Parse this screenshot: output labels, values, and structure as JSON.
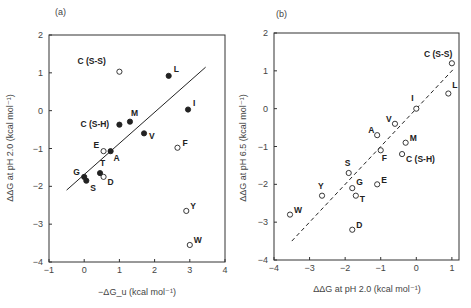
{
  "chart_data": [
    {
      "id": "a",
      "type": "scatter",
      "panel_label": "(a)",
      "title": "",
      "xlabel": "−ΔG_u (kcal mol⁻¹)",
      "ylabel": "ΔΔG at pH 2.0 (kcal mol⁻¹)",
      "xlim": [
        -1,
        4
      ],
      "ylim": [
        -4,
        2
      ],
      "xticks": [
        -1,
        0,
        1,
        2,
        3,
        4
      ],
      "yticks": [
        2,
        1,
        0,
        -1,
        -2,
        -3,
        -4
      ],
      "ytick_labels": [
        "2",
        "1",
        "0",
        "−1",
        "−2",
        "−3",
        "−4"
      ],
      "xtick_labels": [
        "−1",
        "0",
        "1",
        "2",
        "3",
        "4"
      ],
      "grid": false,
      "fit_line": {
        "style": "solid",
        "x": [
          -0.5,
          3.45
        ],
        "y": [
          -2.1,
          1.15
        ]
      },
      "points": [
        {
          "label": "C (S-S)",
          "x": 1.0,
          "y": 1.03,
          "marker": "open",
          "lx": -42,
          "ly": -8
        },
        {
          "label": "L",
          "x": 2.4,
          "y": 0.92,
          "marker": "filled",
          "lx": 5,
          "ly": -4
        },
        {
          "label": "I",
          "x": 2.95,
          "y": 0.03,
          "marker": "filled",
          "lx": 5,
          "ly": -4
        },
        {
          "label": "M",
          "x": 1.3,
          "y": -0.29,
          "marker": "filled",
          "lx": 1,
          "ly": -6
        },
        {
          "label": "C (S-H)",
          "x": 1.0,
          "y": -0.37,
          "marker": "filled",
          "lx": -39,
          "ly": 2
        },
        {
          "label": "V",
          "x": 1.7,
          "y": -0.6,
          "marker": "filled",
          "lx": 5,
          "ly": 6
        },
        {
          "label": "F",
          "x": 2.65,
          "y": -0.98,
          "marker": "open",
          "lx": 5,
          "ly": -2
        },
        {
          "label": "E",
          "x": 0.55,
          "y": -1.07,
          "marker": "open",
          "lx": -10,
          "ly": -3
        },
        {
          "label": "A",
          "x": 0.75,
          "y": -1.07,
          "marker": "filled",
          "lx": 3,
          "ly": 10
        },
        {
          "label": "T",
          "x": 0.45,
          "y": -1.65,
          "marker": "filled",
          "lx": 0,
          "ly": -7
        },
        {
          "label": "D",
          "x": 0.55,
          "y": -1.75,
          "marker": "open",
          "lx": 4,
          "ly": 8
        },
        {
          "label": "G",
          "x": 0.0,
          "y": -1.75,
          "marker": "filled",
          "lx": -11,
          "ly": -2
        },
        {
          "label": "S",
          "x": 0.06,
          "y": -1.85,
          "marker": "filled",
          "lx": 4,
          "ly": 10
        },
        {
          "label": "Y",
          "x": 2.9,
          "y": -2.65,
          "marker": "open",
          "lx": 4,
          "ly": -2
        },
        {
          "label": "W",
          "x": 3.0,
          "y": -3.55,
          "marker": "open",
          "lx": 4,
          "ly": -2
        }
      ],
      "frame_px": {
        "left": 49,
        "right": 225,
        "top": 35,
        "bottom": 262
      }
    },
    {
      "id": "b",
      "type": "scatter",
      "panel_label": "(b)",
      "title": "",
      "xlabel": "ΔΔG at pH 2.0 (kcal mol⁻¹)",
      "ylabel": "ΔΔG at pH 6.5 (kcal mol⁻¹)",
      "xlim": [
        -4,
        1.2
      ],
      "ylim": [
        -4,
        2
      ],
      "xticks": [
        -4,
        -3,
        -2,
        -1,
        0,
        1
      ],
      "yticks": [
        2,
        1,
        0,
        -1,
        -2,
        -3,
        -4
      ],
      "ytick_labels": [
        "2",
        "1",
        "0",
        "−1",
        "−2",
        "−3",
        "−4"
      ],
      "xtick_labels": [
        "−4",
        "−3",
        "−2",
        "−1",
        "0",
        "1"
      ],
      "grid": false,
      "fit_line": {
        "style": "dashed",
        "x": [
          -3.5,
          1.05
        ],
        "y": [
          -3.5,
          1.05
        ]
      },
      "points": [
        {
          "label": "C (S-S)",
          "x": 1.0,
          "y": 1.2,
          "marker": "open",
          "lx": -28,
          "ly": -6
        },
        {
          "label": "L",
          "x": 0.9,
          "y": 0.4,
          "marker": "open",
          "lx": 4,
          "ly": -6
        },
        {
          "label": "I",
          "x": 0.0,
          "y": 0.0,
          "marker": "open",
          "lx": -5,
          "ly": -8
        },
        {
          "label": "V",
          "x": -0.6,
          "y": -0.4,
          "marker": "open",
          "lx": -9,
          "ly": -2
        },
        {
          "label": "A",
          "x": -1.1,
          "y": -0.7,
          "marker": "open",
          "lx": -9,
          "ly": -2
        },
        {
          "label": "M",
          "x": -0.3,
          "y": -0.9,
          "marker": "open",
          "lx": 4,
          "ly": -2
        },
        {
          "label": "F",
          "x": -1.0,
          "y": -1.1,
          "marker": "open",
          "lx": 1,
          "ly": 11
        },
        {
          "label": "C (S-H)",
          "x": -0.4,
          "y": -1.2,
          "marker": "open",
          "lx": 4,
          "ly": 8
        },
        {
          "label": "S",
          "x": -1.9,
          "y": -1.7,
          "marker": "open",
          "lx": -4,
          "ly": -7
        },
        {
          "label": "G",
          "x": -1.8,
          "y": -2.1,
          "marker": "open",
          "lx": 4,
          "ly": -3
        },
        {
          "label": "E",
          "x": -1.1,
          "y": -2.0,
          "marker": "open",
          "lx": 4,
          "ly": -1
        },
        {
          "label": "T",
          "x": -1.7,
          "y": -2.3,
          "marker": "open",
          "lx": 4,
          "ly": 6
        },
        {
          "label": "Y",
          "x": -2.65,
          "y": -2.3,
          "marker": "open",
          "lx": -4,
          "ly": -7
        },
        {
          "label": "W",
          "x": -3.55,
          "y": -2.8,
          "marker": "open",
          "lx": 4,
          "ly": -2
        },
        {
          "label": "D",
          "x": -1.8,
          "y": -3.2,
          "marker": "open",
          "lx": 4,
          "ly": -2
        }
      ],
      "frame_px": {
        "left": 274,
        "right": 459,
        "top": 33,
        "bottom": 260
      }
    }
  ],
  "colors": {
    "ink": "#222222",
    "axis": "#333333",
    "label": "#444444",
    "background": "#ffffff"
  }
}
